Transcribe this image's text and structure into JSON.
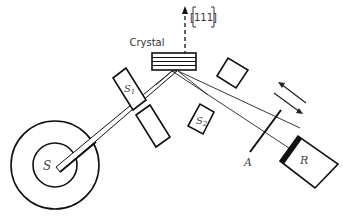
{
  "diagram": {
    "labels": {
      "crystal": "Crystal",
      "direction": "[111]",
      "source": "S",
      "slit1": "S",
      "slit1_sub": "1",
      "slit2": "S",
      "slit2_sub": "2",
      "absorber": "A",
      "receiver": "R"
    },
    "colors": {
      "stroke": "#111111",
      "background": "#ffffff"
    }
  }
}
